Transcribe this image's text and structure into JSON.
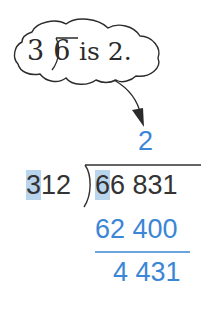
{
  "hint_bubble": {
    "divisor": "3",
    "dividend": "6",
    "text": "is 2."
  },
  "division": {
    "quotient": "2",
    "divisor": "312",
    "divisor_highlight": "3",
    "divisor_rest": "12",
    "dividend_highlight": "6",
    "dividend_rest": "6 831",
    "product": "62 400",
    "remainder": "4 431"
  },
  "colors": {
    "blue": "#3b86d6",
    "highlight": "#b9d5ee",
    "dark": "#333333"
  }
}
